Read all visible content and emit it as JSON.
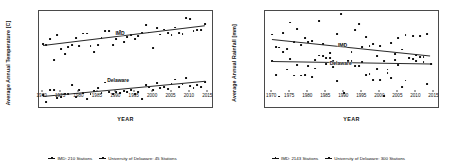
{
  "figure": {
    "panels": [
      "temperature",
      "rainfall"
    ]
  },
  "chart_data": [
    {
      "type": "scatter",
      "id": "temperature",
      "title": "",
      "xlabel": "YEAR",
      "ylabel": "Average Annual Temperature [C]",
      "xlim": [
        1969,
        2016
      ],
      "ylim": [
        22.55,
        25.45
      ],
      "xticks": [
        1970,
        1975,
        1980,
        1985,
        1990,
        1995,
        2000,
        2005,
        2010,
        2015
      ],
      "yticks": [
        23,
        24,
        25
      ],
      "grid": false,
      "legend_position": "bottom",
      "annotations": [
        {
          "text": "IMD",
          "x": 1991,
          "y": 24.78
        },
        {
          "text": "Delaware",
          "x": 1990.5,
          "y": 23.37
        }
      ],
      "legend": [
        "IMD: 210 Stations",
        "University of Delaware: 45 Stations"
      ],
      "series": [
        {
          "name": "IMD: 210 Stations",
          "marker": "square",
          "color": "#111111",
          "trendline": {
            "x": [
              1970,
              2014
            ],
            "y": [
              24.42,
              25.02
            ]
          },
          "x": [
            1970,
            1971,
            1972,
            1973,
            1974,
            1975,
            1976,
            1977,
            1978,
            1979,
            1980,
            1981,
            1982,
            1983,
            1984,
            1985,
            1986,
            1987,
            1988,
            1989,
            1990,
            1991,
            1992,
            1993,
            1994,
            1995,
            1996,
            1997,
            1998,
            1999,
            2000,
            2001,
            2002,
            2003,
            2004,
            2005,
            2006,
            2007,
            2008,
            2009,
            2010,
            2011,
            2012,
            2013,
            2014
          ],
          "y": [
            24.45,
            24.41,
            24.6,
            23.96,
            24.72,
            24.3,
            24.16,
            24.36,
            24.42,
            24.63,
            24.4,
            24.77,
            24.77,
            24.4,
            24.21,
            24.42,
            24.63,
            24.85,
            24.85,
            24.43,
            24.59,
            24.86,
            24.52,
            24.66,
            24.72,
            24.6,
            24.69,
            24.78,
            25.03,
            24.8,
            24.32,
            24.93,
            24.74,
            24.89,
            24.79,
            24.72,
            24.95,
            24.78,
            24.75,
            25.24,
            25.22,
            24.85,
            24.88,
            24.87,
            25.06
          ]
        },
        {
          "name": "University of Delaware: 45 Stations",
          "marker": "square",
          "color": "#111111",
          "trendline": {
            "x": [
              1970,
              2014
            ],
            "y": [
              22.88,
              23.34
            ]
          },
          "x": [
            1970,
            1971,
            1972,
            1973,
            1974,
            1975,
            1976,
            1977,
            1978,
            1979,
            1980,
            1981,
            1982,
            1983,
            1984,
            1985,
            1986,
            1987,
            1988,
            1989,
            1990,
            1991,
            1992,
            1993,
            1994,
            1995,
            1996,
            1997,
            1998,
            1999,
            2000,
            2001,
            2002,
            2003,
            2004,
            2005,
            2006,
            2007,
            2008,
            2009,
            2010,
            2011,
            2012,
            2013,
            2014
          ],
          "y": [
            22.92,
            22.71,
            23.05,
            23.06,
            22.82,
            22.86,
            22.93,
            22.95,
            23.21,
            22.86,
            23.06,
            22.97,
            22.78,
            22.95,
            23.03,
            23.12,
            22.96,
            23.29,
            23.0,
            22.93,
            23.01,
            22.98,
            23.02,
            23.0,
            23.05,
            22.93,
            23.0,
            22.79,
            23.21,
            23.14,
            23.06,
            23.27,
            23.12,
            23.16,
            23.1,
            23.24,
            23.38,
            23.15,
            23.24,
            23.42,
            23.18,
            23.11,
            23.22,
            23.14,
            23.3
          ]
        }
      ]
    },
    {
      "type": "scatter",
      "id": "rainfall",
      "title": "",
      "xlabel": "YEAR",
      "ylabel": "Average Annual Rainfall [mm]",
      "xlim": [
        1968,
        2016
      ],
      "ylim": [
        880,
        1460
      ],
      "xticks": [
        1970,
        1975,
        1980,
        1985,
        1990,
        1995,
        2000,
        2005,
        2010,
        2015
      ],
      "yticks": [
        900,
        1000,
        1100,
        1200,
        1300,
        1400
      ],
      "grid": false,
      "legend_position": "bottom",
      "annotations": [
        {
          "text": "IMD",
          "x": 1989.5,
          "y": 1255
        },
        {
          "text": "Delaware",
          "x": 1989,
          "y": 1145
        }
      ],
      "legend": [
        "IMD: 2143 Stations",
        "University of Delaware: 300 Stations"
      ],
      "series": [
        {
          "name": "IMD: 2143 Stations",
          "marker": "square",
          "color": "#111111",
          "trendline": {
            "x": [
              1970,
              2014
            ],
            "y": [
              1292,
              1192
            ]
          },
          "x": [
            1970,
            1971,
            1972,
            1973,
            1974,
            1975,
            1976,
            1977,
            1978,
            1979,
            1980,
            1981,
            1982,
            1983,
            1984,
            1985,
            1986,
            1987,
            1988,
            1989,
            1990,
            1991,
            1992,
            1993,
            1994,
            1995,
            1996,
            1997,
            1998,
            1999,
            2000,
            2001,
            2002,
            2003,
            2004,
            2005,
            2006,
            2007,
            2008,
            2009,
            2010,
            2011,
            2012,
            2013,
            2014
          ],
          "y": [
            1318,
            1241,
            1239,
            1329,
            1229,
            1390,
            1270,
            1351,
            1253,
            1297,
            1273,
            1280,
            1164,
            1399,
            1262,
            1178,
            1177,
            1123,
            1322,
            1439,
            1256,
            1160,
            1156,
            1346,
            1380,
            1242,
            1302,
            1246,
            1262,
            1188,
            1246,
            1158,
            1106,
            1268,
            1199,
            1294,
            1227,
            1313,
            1176,
            1306,
            1195,
            1307,
            1181,
            1321,
            1142
          ]
        },
        {
          "name": "University of Delaware: 300 Stations",
          "marker": "square",
          "color": "#111111",
          "trendline": {
            "x": [
              1970,
              2014
            ],
            "y": [
              1157,
              1142
            ]
          },
          "x": [
            1970,
            1971,
            1972,
            1973,
            1974,
            1975,
            1976,
            1977,
            1978,
            1979,
            1980,
            1981,
            1982,
            1983,
            1984,
            1985,
            1986,
            1987,
            1988,
            1989,
            1990,
            1991,
            1992,
            1993,
            1994,
            1995,
            1996,
            1997,
            1998,
            1999,
            2000,
            2001,
            2002,
            2003,
            2004,
            2005,
            2006,
            2007,
            2008,
            2009,
            2010,
            2011,
            2012,
            2013,
            2014
          ],
          "y": [
            1160,
            1073,
            943,
            1210,
            1106,
            1168,
            1070,
            1136,
            1070,
            1071,
            1129,
            1063,
            1112,
            1191,
            1189,
            1139,
            1206,
            1158,
            1039,
            1257,
            965,
            1160,
            1213,
            1127,
            1127,
            1150,
            1074,
            1079,
            1043,
            1108,
            1041,
            947,
            1084,
            1055,
            1165,
            1136,
            1000,
            1040,
            1179,
            1171,
            1157,
            1180,
            1152,
            1016,
            1141
          ]
        }
      ]
    }
  ]
}
